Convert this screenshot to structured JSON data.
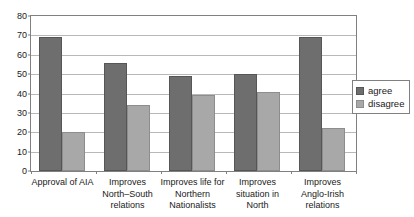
{
  "chart_data": {
    "type": "bar",
    "title": "",
    "subtitle": "",
    "xlabel": "",
    "ylabel": "",
    "ylim": [
      0,
      80
    ],
    "ytick_step": 10,
    "yticks": [
      "0",
      "10",
      "20",
      "30",
      "40",
      "50",
      "60",
      "70",
      "80"
    ],
    "grid": true,
    "legend_position": "right",
    "categories": [
      "Approval of AIA",
      "Improves\nNorth–South\nrelations",
      "Improves life for\nNorthern\nNationalists",
      "Improves\nsituation in\nNorth",
      "Improves\nAnglo-Irish\nrelations"
    ],
    "series": [
      {
        "name": "agree",
        "color": "#6e6e6e",
        "values": [
          69,
          56,
          49,
          50,
          69
        ]
      },
      {
        "name": "disagree",
        "color": "#a8a8a8",
        "values": [
          20,
          34,
          39,
          41,
          22
        ]
      }
    ]
  },
  "legend": {
    "items": [
      {
        "label": "agree"
      },
      {
        "label": "disagree"
      }
    ]
  }
}
